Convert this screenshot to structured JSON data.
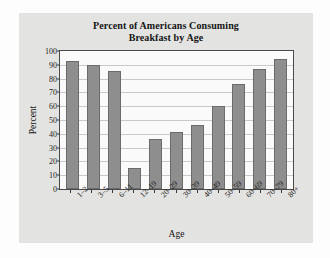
{
  "chart_data": {
    "type": "bar",
    "title": "Percent of Americans Consuming Breakfast by Age",
    "title_line1": "Percent of Americans Consuming",
    "title_line2": "Breakfast by Age",
    "xlabel": "Age",
    "ylabel": "Percent",
    "categories": [
      "1–2",
      "3–5",
      "6–11",
      "12–19",
      "20–29",
      "30–39",
      "40–49",
      "50–59",
      "60–69",
      "70–79",
      "80+"
    ],
    "values": [
      93,
      90,
      85.5,
      15,
      36.5,
      41,
      46.5,
      60.5,
      76,
      87,
      94.5
    ],
    "ylim": [
      0,
      100
    ],
    "yticks": [
      0,
      10,
      20,
      30,
      40,
      50,
      60,
      70,
      80,
      90,
      100
    ],
    "ytick_labels": [
      "0",
      "10",
      "20",
      "30",
      "40",
      "50",
      "60",
      "70",
      "80",
      "90",
      "100"
    ],
    "grid": true,
    "legend": null,
    "bar_color": "#8e8e8e",
    "bar_edge_color": "#6b6b6b",
    "plot_background": "#fafafa",
    "panel_background": "#e3e3e1",
    "axis_color": "#4a4a4a",
    "grid_color": "#c9c9c9"
  }
}
